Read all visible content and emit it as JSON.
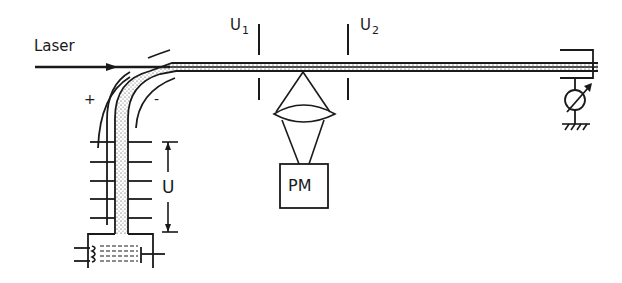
{
  "diagram": {
    "title": "",
    "labels": {
      "laser": "Laser",
      "u1_main": "U",
      "u1_sub": "1",
      "u2_main": "U",
      "u2_sub": "2",
      "plus": "+",
      "minus": "-",
      "voltage": "U",
      "photomultiplier": "PM"
    },
    "components": [
      {
        "id": "laser-beam",
        "label": "Laser"
      },
      {
        "id": "curved-deflector",
        "polarity": [
          "+",
          "-"
        ]
      },
      {
        "id": "acceleration-column",
        "label": "U"
      },
      {
        "id": "ion-source",
        "label": ""
      },
      {
        "id": "aperture-1",
        "label": "U1"
      },
      {
        "id": "aperture-2",
        "label": "U2"
      },
      {
        "id": "lens",
        "label": ""
      },
      {
        "id": "photomultiplier",
        "label": "PM"
      },
      {
        "id": "faraday-cup",
        "label": ""
      },
      {
        "id": "current-meter",
        "label": ""
      },
      {
        "id": "ground",
        "label": ""
      }
    ],
    "colors": {
      "ink": "#1a1a1a",
      "background": "#ffffff"
    }
  }
}
